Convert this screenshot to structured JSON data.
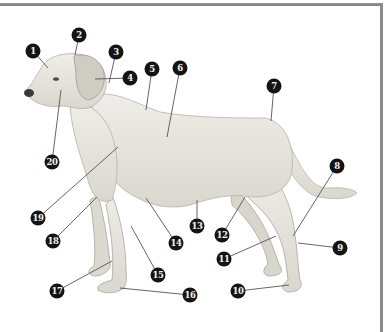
{
  "diagram": {
    "colors": {
      "frame": "#8a8a8a",
      "marker_fill": "#141414",
      "marker_text": "#f2f2f2",
      "leader_line": "#555555",
      "dog_fur": "#e9e7e0"
    },
    "markers": [
      {
        "id": 1,
        "label": "1",
        "x": 33,
        "y": 51,
        "tx": 48,
        "ty": 68
      },
      {
        "id": 2,
        "label": "2",
        "x": 79,
        "y": 35,
        "tx": 75,
        "ty": 55
      },
      {
        "id": 3,
        "label": "3",
        "x": 116,
        "y": 52,
        "tx": 109,
        "ty": 83
      },
      {
        "id": 4,
        "label": "4",
        "x": 130,
        "y": 78,
        "tx": 95,
        "ty": 79
      },
      {
        "id": 5,
        "label": "5",
        "x": 152,
        "y": 69,
        "tx": 146,
        "ty": 110
      },
      {
        "id": 6,
        "label": "6",
        "x": 180,
        "y": 68,
        "tx": 167,
        "ty": 137
      },
      {
        "id": 7,
        "label": "7",
        "x": 274,
        "y": 86,
        "tx": 271,
        "ty": 121
      },
      {
        "id": 8,
        "label": "8",
        "x": 337,
        "y": 166,
        "tx": 293,
        "ty": 236
      },
      {
        "id": 9,
        "label": "9",
        "x": 340,
        "y": 248,
        "tx": 298,
        "ty": 243
      },
      {
        "id": 10,
        "label": "10",
        "x": 238,
        "y": 291,
        "tx": 289,
        "ty": 285
      },
      {
        "id": 11,
        "label": "11",
        "x": 224,
        "y": 259,
        "tx": 276,
        "ty": 236
      },
      {
        "id": 12,
        "label": "12",
        "x": 222,
        "y": 235,
        "tx": 245,
        "ty": 197
      },
      {
        "id": 13,
        "label": "13",
        "x": 197,
        "y": 226,
        "tx": 197,
        "ty": 200
      },
      {
        "id": 14,
        "label": "14",
        "x": 176,
        "y": 243,
        "tx": 146,
        "ty": 198
      },
      {
        "id": 15,
        "label": "15",
        "x": 158,
        "y": 275,
        "tx": 131,
        "ty": 226
      },
      {
        "id": 16,
        "label": "16",
        "x": 190,
        "y": 295,
        "tx": 120,
        "ty": 288
      },
      {
        "id": 17,
        "label": "17",
        "x": 57,
        "y": 291,
        "tx": 112,
        "ty": 261
      },
      {
        "id": 18,
        "label": "18",
        "x": 53,
        "y": 241,
        "tx": 97,
        "ty": 197
      },
      {
        "id": 19,
        "label": "19",
        "x": 38,
        "y": 218,
        "tx": 118,
        "ty": 147
      },
      {
        "id": 20,
        "label": "20",
        "x": 52,
        "y": 162,
        "tx": 61,
        "ty": 90
      }
    ]
  }
}
